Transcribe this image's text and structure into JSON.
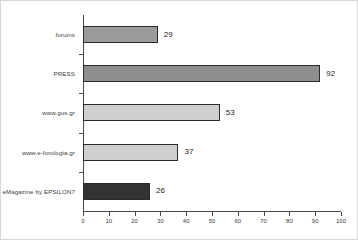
{
  "chart_data": {
    "type": "bar",
    "orientation": "horizontal",
    "title": "",
    "subtitle": "",
    "xlabel": "",
    "ylabel": "",
    "xlim": [
      0,
      100
    ],
    "xticks": [
      0,
      10,
      20,
      30,
      40,
      50,
      60,
      70,
      80,
      90,
      100
    ],
    "grid": false,
    "legend": false,
    "categories": [
      "forums",
      "PRESS",
      "www.gus.gr",
      "www.e-forologia.gr",
      "eMagazine by EPSILON7"
    ],
    "values": [
      29,
      92,
      53,
      37,
      26
    ],
    "value_labels": [
      "29",
      "92",
      "53",
      "37",
      "26"
    ],
    "bar_colors": [
      "#9a9a9a",
      "#8e8e8e",
      "#cfcfcf",
      "#cfcfcf",
      "#333333"
    ],
    "bar_edge_color": "#2b2b2b",
    "axis_color": "#4a4a4a",
    "background": "#ffffff",
    "bars": [
      {
        "category": "forums",
        "value": 29,
        "label": "29",
        "color": "#9a9a9a"
      },
      {
        "category": "PRESS",
        "value": 92,
        "label": "92",
        "color": "#8e8e8e"
      },
      {
        "category": "www.gus.gr",
        "value": 53,
        "label": "53",
        "color": "#cfcfcf"
      },
      {
        "category": "www.e-forologia.gr",
        "value": 37,
        "label": "37",
        "color": "#cfcfcf"
      },
      {
        "category": "eMagazine by EPSILON7",
        "value": 26,
        "label": "26",
        "color": "#333333"
      }
    ]
  }
}
